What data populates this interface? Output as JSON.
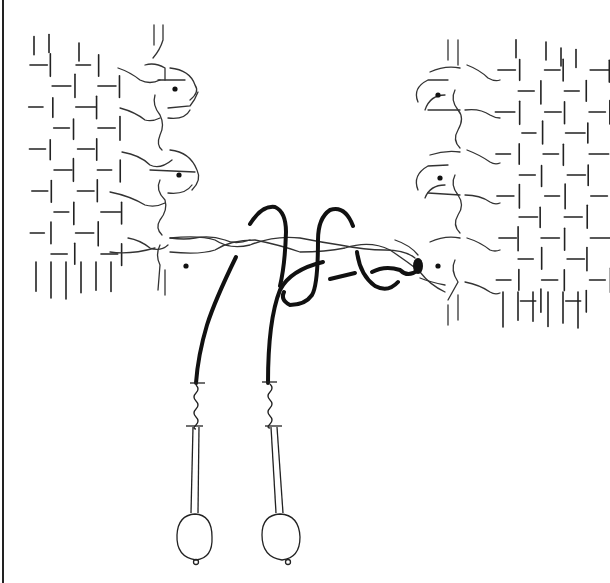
{
  "figure": {
    "description": "Line drawing of two woven fabric panels joined by a twisted weft; two threads on bobbins form a knot across the gap",
    "left_panel": {
      "selvedge_loops": 3,
      "dots": 3
    },
    "right_panel": {
      "selvedge_loops": 3,
      "dots": 3
    },
    "bobbins": [
      {
        "label": "bobbin-1",
        "x": 195
      },
      {
        "label": "bobbin-2",
        "x": 270
      }
    ],
    "colors": {
      "ink": "#222222",
      "paper": "#ffffff"
    }
  }
}
